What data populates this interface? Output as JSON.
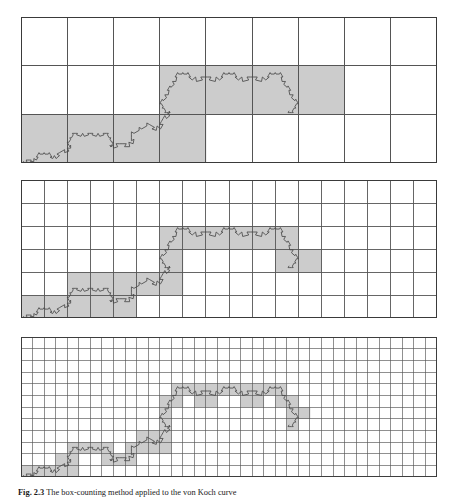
{
  "figure": {
    "label": "Fig. 2.3",
    "caption_text": "Fig. 2.3   The box-counting method applied to the von Koch curve",
    "caption_bold": "Fig. 2.3",
    "caption_rest": "The box-counting method applied to the von Koch curve",
    "background_color": "#ffffff",
    "grid_line_color": "#555555",
    "grid_line_color_minor": "#777777",
    "curve_color": "#4a4a4a",
    "shaded_cell_color": "#cccccc",
    "unshaded_cell_color": "#ffffff",
    "border_color": "#3a3a3a"
  },
  "curve": {
    "name": "von-koch-curve",
    "type": "koch",
    "iterations": 5,
    "base_span_note": "curve spans full panel width, base on bottom grid line",
    "apex_height_ratio": 0.2886751346
  },
  "panels": [
    {
      "id": "panel-1",
      "name": "box-counting-grid-coarse",
      "x": 21,
      "y": 17,
      "width": 416,
      "height": 146,
      "cols": 9,
      "rows": 3,
      "cell_size_px": 46.2,
      "box_count": 23,
      "grid_stroke": 1.1
    },
    {
      "id": "panel-2",
      "name": "box-counting-grid-medium",
      "x": 21,
      "y": 180,
      "width": 416,
      "height": 138,
      "cols": 18,
      "rows": 6,
      "cell_size_px": 23.1,
      "box_count": 52,
      "grid_stroke": 0.9
    },
    {
      "id": "panel-3",
      "name": "box-counting-grid-fine",
      "x": 21,
      "y": 337,
      "width": 416,
      "height": 140,
      "cols": 36,
      "rows": 12,
      "cell_size_px": 11.55,
      "box_count": 120,
      "grid_stroke": 0.65
    }
  ]
}
